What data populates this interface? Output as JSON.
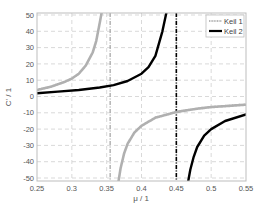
{
  "chart_data": {
    "type": "line",
    "title": "",
    "xlabel": "μ / 1",
    "ylabel": "C' / 1",
    "xlim": [
      0.25,
      0.55
    ],
    "ylim": [
      -52,
      52
    ],
    "xticks": [
      0.25,
      0.3,
      0.35,
      0.4,
      0.45,
      0.5,
      0.55
    ],
    "xtick_labels": [
      "0.25",
      "0.3",
      "0.35",
      "0.4",
      "0.45",
      "0.5",
      "0.55"
    ],
    "yticks": [
      50,
      40,
      30,
      20,
      10,
      0,
      -10,
      -20,
      -30,
      -40,
      -50
    ],
    "ytick_labels": [
      "50",
      "40",
      "30",
      "20",
      "10",
      "0",
      "-10",
      "-20",
      "-30",
      "-40",
      "-50"
    ],
    "grid": true,
    "legend_position": "upper right",
    "series": [
      {
        "name": "Keil 1",
        "color": "#b0b0b0",
        "style": "thick hatched gray",
        "asymptote_x": 0.355,
        "branches": [
          {
            "x": [
              0.25,
              0.27,
              0.29,
              0.3,
              0.31,
              0.32,
              0.33,
              0.335,
              0.34,
              0.343
            ],
            "y": [
              4,
              6,
              9,
              11,
              14,
              19,
              27,
              34,
              45,
              52
            ]
          },
          {
            "x": [
              0.367,
              0.37,
              0.375,
              0.38,
              0.39,
              0.4,
              0.42,
              0.45,
              0.48,
              0.5,
              0.55
            ],
            "y": [
              -52,
              -44,
              -35,
              -29,
              -22,
              -18,
              -13,
              -9.5,
              -7.5,
              -6.5,
              -5
            ]
          }
        ]
      },
      {
        "name": "Keil 2",
        "color": "#000000",
        "style": "thick solid black",
        "asymptote_x": 0.45,
        "branches": [
          {
            "x": [
              0.25,
              0.28,
              0.31,
              0.34,
              0.36,
              0.38,
              0.4,
              0.41,
              0.42,
              0.43,
              0.436
            ],
            "y": [
              2,
              3,
              4,
              5.5,
              7,
              9.5,
              14,
              18,
              25,
              40,
              52
            ]
          },
          {
            "x": [
              0.467,
              0.47,
              0.475,
              0.48,
              0.49,
              0.5,
              0.52,
              0.55
            ],
            "y": [
              -52,
              -45,
              -37,
              -31,
              -24,
              -20,
              -15,
              -11
            ]
          }
        ]
      }
    ],
    "annotations": [
      {
        "type": "vline",
        "x": 0.355,
        "color": "#a8a8a8",
        "style": "dash-dot"
      },
      {
        "type": "vline",
        "x": 0.45,
        "color": "#000000",
        "style": "dash-dot"
      }
    ]
  },
  "legend": {
    "items": [
      {
        "label": "Keil 1"
      },
      {
        "label": "Keil 2"
      }
    ]
  },
  "axes": {
    "xlabel": "μ / 1",
    "ylabel": "C' / 1"
  }
}
